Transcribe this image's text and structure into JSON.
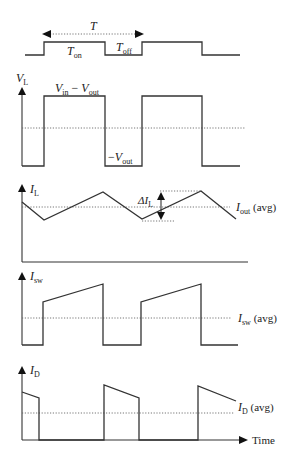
{
  "figure": {
    "gate_signal": {
      "period_label": "T",
      "on_label": "T",
      "on_sub": "on",
      "off_label": "T",
      "off_sub": "off",
      "points": "25,55 44,55 44,42 105,42 105,55 142,55 142,42 202,42 202,55 240,55"
    },
    "vl_panel": {
      "axis_label": "V",
      "axis_sub": "L",
      "high_label_a": "V",
      "high_label_a_sub": "in",
      "high_label_minus": " − ",
      "high_label_b": "V",
      "high_label_b_sub": "out",
      "low_label_minus": "−",
      "low_label": "V",
      "low_label_sub": "out",
      "points": "22,166 44,166 44,96 105,96 105,166 142,166 142,96 202,96 202,166 240,166"
    },
    "il_panel": {
      "axis_label": "I",
      "axis_sub": "L",
      "ripple_label": "ΔI",
      "ripple_sub": "L",
      "avg_label": "I",
      "avg_sub": "out",
      "avg_suffix": " (avg)",
      "points": "22,202 44,220 103,192 142,219 201,191 236,219"
    },
    "isw_panel": {
      "axis_label": "I",
      "axis_sub": "sw",
      "avg_label": "I",
      "avg_sub": "sw",
      "avg_suffix": " (avg)",
      "points": "22,345 43,345 43,302 103,284 103,345 141,345 141,302 201,284 201,345 238,345"
    },
    "id_panel": {
      "axis_label": "I",
      "axis_sub": "D",
      "avg_label": "I",
      "avg_sub": "D",
      "avg_suffix": " (avg)",
      "x_axis_label": "Time",
      "points": "22,392 39,398 39,440 104,440 104,385 139,398 139,440 198,440 198,386 236,401"
    }
  }
}
